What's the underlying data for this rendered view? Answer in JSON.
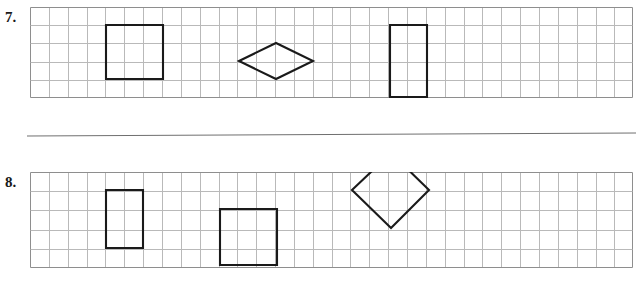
{
  "worksheet": {
    "title": "Grid Shapes Worksheet",
    "colors": {
      "grid_line": "#b9b9b9",
      "grid_border": "#8e8e8e",
      "shape_stroke": "#1a1a1a",
      "divider": "#6f6f6f",
      "page_background": "#ffffff",
      "label_text": "#1a1a1a"
    },
    "divider": {
      "name": "horizontal-rule",
      "x1": 0,
      "y1": 6,
      "x2": 609,
      "y2": 3,
      "stroke_width": 1
    },
    "problems": [
      {
        "label": "7.",
        "panel": {
          "name": "grid-panel-7",
          "x": 30,
          "y": 7,
          "width": 603,
          "height": 91,
          "cell_size": 18.85,
          "columns": 32,
          "rows": 5
        },
        "shapes": [
          {
            "name": "square",
            "type": "polygon",
            "points": "76,18 133,18 133,72 76,72",
            "stroke_width": 2.1
          },
          {
            "name": "rhombus-horizontal",
            "type": "polygon",
            "points": "209,54 246,36 283,54 246,72",
            "stroke_width": 2.1
          },
          {
            "name": "rectangle-vertical",
            "type": "polygon",
            "points": "360,18 397,18 397,90 360,90",
            "stroke_width": 2.1
          }
        ]
      },
      {
        "label": "8.",
        "panel": {
          "name": "grid-panel-8",
          "x": 30,
          "y": 172,
          "width": 603,
          "height": 96,
          "cell_size": 18.85,
          "columns": 32,
          "rows": 5
        },
        "shapes": [
          {
            "name": "rectangle-vertical",
            "type": "polygon",
            "points": "76,18 113,18 113,76 76,76",
            "stroke_width": 2.1
          },
          {
            "name": "square",
            "type": "polygon",
            "points": "190,37 247,37 247,93 190,93",
            "stroke_width": 2.1
          },
          {
            "name": "diamond-square-rotated",
            "type": "polygon",
            "points": "361,56 322,18 361,-19 399,18",
            "stroke_width": 2.1
          }
        ]
      }
    ],
    "chart_data": {
      "type": "table",
      "title": "Grid Shapes Worksheet",
      "description": "Two ruled grid strips, each containing three outlined geometric figures drawn on square graph paper.",
      "grid": {
        "cell_size_px": 18.85,
        "columns": 32,
        "rows": 5
      },
      "rows": [
        {
          "problem": "7.",
          "shapes": [
            {
              "shape": "square",
              "grid_width_cells": 3,
              "grid_height_cells": 3,
              "top_left_cell": [
                4,
                1
              ]
            },
            {
              "shape": "rhombus",
              "diagonal_horizontal_cells": 4,
              "diagonal_vertical_cells": 2,
              "center_cell": [
                13,
                2.5
              ]
            },
            {
              "shape": "rectangle",
              "grid_width_cells": 2,
              "grid_height_cells": 4,
              "top_left_cell": [
                19,
                1
              ]
            }
          ]
        },
        {
          "problem": "8.",
          "shapes": [
            {
              "shape": "rectangle",
              "grid_width_cells": 2,
              "grid_height_cells": 3,
              "top_left_cell": [
                4,
                1
              ]
            },
            {
              "shape": "square",
              "grid_width_cells": 3,
              "grid_height_cells": 3,
              "top_left_cell": [
                10,
                2
              ]
            },
            {
              "shape": "square-rotated-45",
              "diagonal_cells": 4,
              "center_cell": [
                19.2,
                2
              ]
            }
          ]
        }
      ]
    }
  }
}
